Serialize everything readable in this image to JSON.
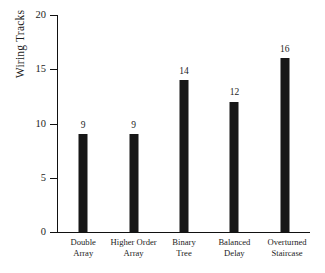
{
  "chart_data": {
    "type": "bar",
    "title": "",
    "xlabel": "",
    "ylabel": "Wiring Tracks",
    "ylim": [
      0,
      20
    ],
    "yticks": [
      0,
      5,
      10,
      15,
      20
    ],
    "grid": false,
    "legend": null,
    "categories": [
      "Double Array",
      "Higher Order Array",
      "Binary Tree",
      "Balanced Delay",
      "Overturned Staircase"
    ],
    "category_lines": [
      [
        "Double",
        "Array"
      ],
      [
        "Higher Order",
        "Array"
      ],
      [
        "Binary",
        "Tree"
      ],
      [
        "Balanced",
        "Delay"
      ],
      [
        "Overturned",
        "Staircase"
      ]
    ],
    "values": [
      9,
      9,
      14,
      12,
      16
    ],
    "value_labels": [
      "9",
      "9",
      "14",
      "12",
      "16"
    ],
    "bar_color": "#171717",
    "axis_color": "#111111",
    "background_color": "#ffffff"
  },
  "axis": {
    "y_tick_labels": [
      "20",
      "15",
      "10",
      "5",
      "0"
    ],
    "y_title": "Wiring Tracks"
  }
}
